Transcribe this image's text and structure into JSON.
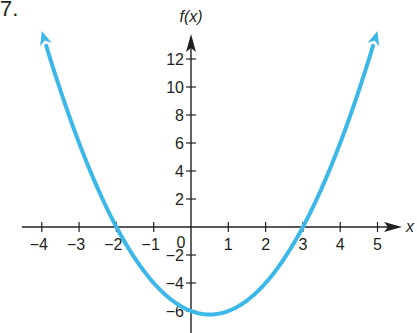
{
  "problem_number": "7.",
  "chart_data": {
    "type": "line",
    "title": "",
    "function": "f(x) = x^2 - x - 6",
    "xlabel": "x",
    "ylabel": "f(x)",
    "x_ticks": [
      -4,
      -3,
      -2,
      -1,
      1,
      2,
      3,
      4,
      5
    ],
    "y_ticks": [
      -6,
      -4,
      -2,
      2,
      4,
      6,
      8,
      10,
      12
    ],
    "origin_label": "0",
    "xlim": [
      -4.5,
      5.6
    ],
    "ylim": [
      -7,
      14
    ],
    "grid": false,
    "series": [
      {
        "name": "f(x)",
        "color": "#3BB8E8",
        "x": [
          -4,
          -3,
          -2,
          -1,
          0,
          0.5,
          1,
          2,
          3,
          4,
          5
        ],
        "y": [
          14,
          6,
          0,
          -4,
          -6,
          -6.25,
          -6,
          -4,
          0,
          6,
          14
        ],
        "arrows_at_ends": true
      }
    ],
    "key_points": {
      "x_intercepts": [
        -2,
        3
      ],
      "y_intercept": -6,
      "vertex": [
        0.5,
        -6.25
      ]
    },
    "axis_color": "#231f20"
  }
}
